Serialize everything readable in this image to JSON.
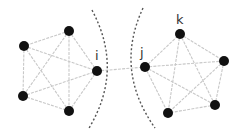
{
  "diagram": {
    "colors": {
      "node": "#111111",
      "edge": "#c8c8c8",
      "cut": "#555555",
      "label": "#333333"
    },
    "labels": {
      "i": "i",
      "j": "j",
      "k": "k"
    },
    "left_cluster": {
      "nodes": [
        {
          "id": "L1",
          "x": 69,
          "y": 31
        },
        {
          "id": "L2",
          "x": 24,
          "y": 46
        },
        {
          "id": "L3",
          "x": 23,
          "y": 96
        },
        {
          "id": "L4",
          "x": 69,
          "y": 111
        },
        {
          "id": "i",
          "x": 97,
          "y": 71,
          "label": "i"
        }
      ]
    },
    "right_cluster": {
      "nodes": [
        {
          "id": "j",
          "x": 145,
          "y": 67,
          "label": "j"
        },
        {
          "id": "k",
          "x": 180,
          "y": 34,
          "label": "k"
        },
        {
          "id": "R2",
          "x": 224,
          "y": 61
        },
        {
          "id": "R3",
          "x": 215,
          "y": 105
        },
        {
          "id": "R4",
          "x": 168,
          "y": 113
        }
      ]
    },
    "bridge_edge": {
      "from": "i",
      "to": "j"
    }
  }
}
